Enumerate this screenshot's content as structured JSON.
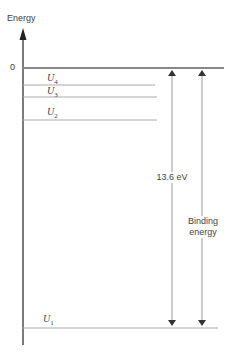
{
  "axis": {
    "label": "Energy",
    "zero_label": "0"
  },
  "levels": [
    {
      "name": "U",
      "sub": "4",
      "y": 85
    },
    {
      "name": "U",
      "sub": "3",
      "y": 97
    },
    {
      "name": "U",
      "sub": "2",
      "y": 120
    },
    {
      "name": "U",
      "sub": "1",
      "y": 328
    }
  ],
  "annotations": {
    "ionization": "13.6 eV",
    "binding_line1": "Binding",
    "binding_line2": "energy"
  },
  "colors": {
    "line": "#999999",
    "zero_line": "#888888",
    "axis": "#333333"
  }
}
